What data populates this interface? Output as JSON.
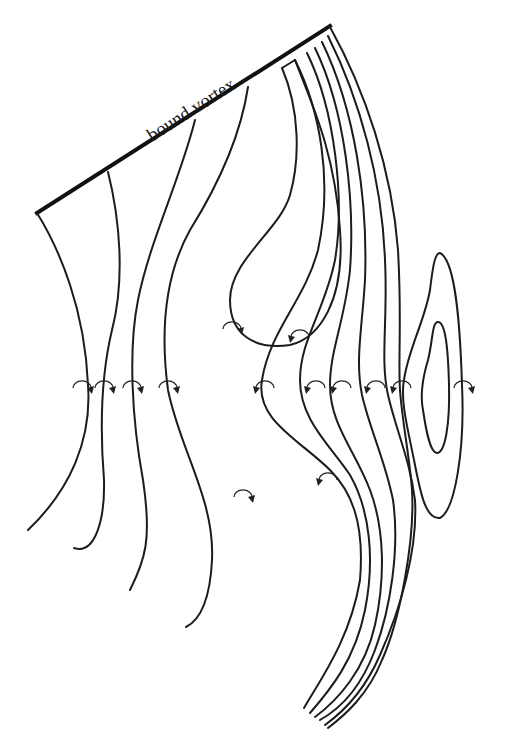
{
  "figure": {
    "label": "bound vortex",
    "label_position": {
      "x": 200,
      "y": 100,
      "rotate": -32.7
    },
    "colors": {
      "line": "#1c1c1c",
      "background": "#ffffff"
    },
    "bound_vortex": {
      "x1": 37,
      "y1": 213,
      "x2": 330,
      "y2": 26
    },
    "vortex_lines": [
      {
        "id": "l1",
        "d": "M37,213 C60,250 85,310 88,385 C92,440 70,490 28,530"
      },
      {
        "id": "l2",
        "d": "M108,172 C120,220 125,280 112,330 C100,380 100,430 104,480 C105,520 95,555 74,548"
      },
      {
        "id": "l3",
        "d": "M195,120 C180,180 150,240 138,300 C128,350 132,420 143,480 C152,540 145,560 130,590"
      },
      {
        "id": "l4",
        "d": "M248,87 C240,140 215,190 190,230 C165,275 160,330 168,390 C180,450 215,500 212,560 C210,600 200,620 186,627"
      },
      {
        "id": "l5",
        "d": "M282,68 C300,110 300,160 290,195 C280,230 230,260 230,300 C230,335 255,350 290,345 C320,338 345,300 340,230 C335,150 310,100 295,60 M282,68 L295,60"
      },
      {
        "id": "l5b",
        "d": "M295,60 C320,110 333,180 318,250 C305,300 270,330 262,380 C255,420 300,440 330,470 C350,490 365,520 360,580 C350,640 320,680 304,708"
      },
      {
        "id": "l6",
        "d": "M307,53 C335,110 345,200 335,260 C325,310 300,340 300,380 C300,420 330,445 350,475 C370,510 375,560 365,610 C355,660 330,690 310,713"
      },
      {
        "id": "l7",
        "d": "M315,48 C345,110 355,200 350,270 C345,320 330,350 330,385 C330,425 355,450 370,490 C385,530 385,580 375,625 C365,670 338,700 315,717"
      },
      {
        "id": "l8",
        "d": "M322,42 C355,110 368,200 365,280 C362,330 355,360 362,395 C370,430 385,460 393,500 C400,550 390,610 375,650 C360,690 338,710 320,720"
      },
      {
        "id": "l9",
        "d": "M328,36 C360,100 382,180 385,260 C388,320 380,360 388,395 C396,430 410,460 415,500 C418,550 400,610 380,655 C365,690 343,712 325,725"
      },
      {
        "id": "l10",
        "d": "M330,27 C365,90 392,170 398,250 C402,320 398,360 400,390 C402,420 410,460 412,490 C415,540 400,620 382,660 C368,695 345,715 328,728"
      }
    ],
    "closed_loops": [
      {
        "id": "outer",
        "d": "M440,253 C455,260 460,320 462,385 C465,450 455,510 440,518 C425,520 420,490 414,460 C408,430 400,400 404,380 C408,350 425,320 430,290 C433,265 435,253 440,253 Z"
      },
      {
        "id": "inner",
        "d": "M438,322 C445,322 448,345 449,385 C450,425 445,453 437,453 C430,453 426,430 423,410 C420,395 422,380 428,360 C433,340 432,322 438,322 Z"
      }
    ],
    "rotation_arrows": [
      {
        "x": 82,
        "y": 386,
        "dir": "cw"
      },
      {
        "x": 104,
        "y": 386,
        "dir": "cw"
      },
      {
        "x": 132,
        "y": 386,
        "dir": "cw"
      },
      {
        "x": 168,
        "y": 386,
        "dir": "cw"
      },
      {
        "x": 265,
        "y": 386,
        "dir": "ccw"
      },
      {
        "x": 316,
        "y": 386,
        "dir": "ccw"
      },
      {
        "x": 342,
        "y": 386,
        "dir": "ccw"
      },
      {
        "x": 376,
        "y": 386,
        "dir": "ccw"
      },
      {
        "x": 402,
        "y": 386,
        "dir": "ccw"
      },
      {
        "x": 463,
        "y": 386,
        "dir": "cw"
      },
      {
        "x": 232,
        "y": 327,
        "dir": "cw"
      },
      {
        "x": 300,
        "y": 335,
        "dir": "ccw"
      },
      {
        "x": 243,
        "y": 495,
        "dir": "cw"
      },
      {
        "x": 328,
        "y": 478,
        "dir": "ccw"
      }
    ]
  }
}
